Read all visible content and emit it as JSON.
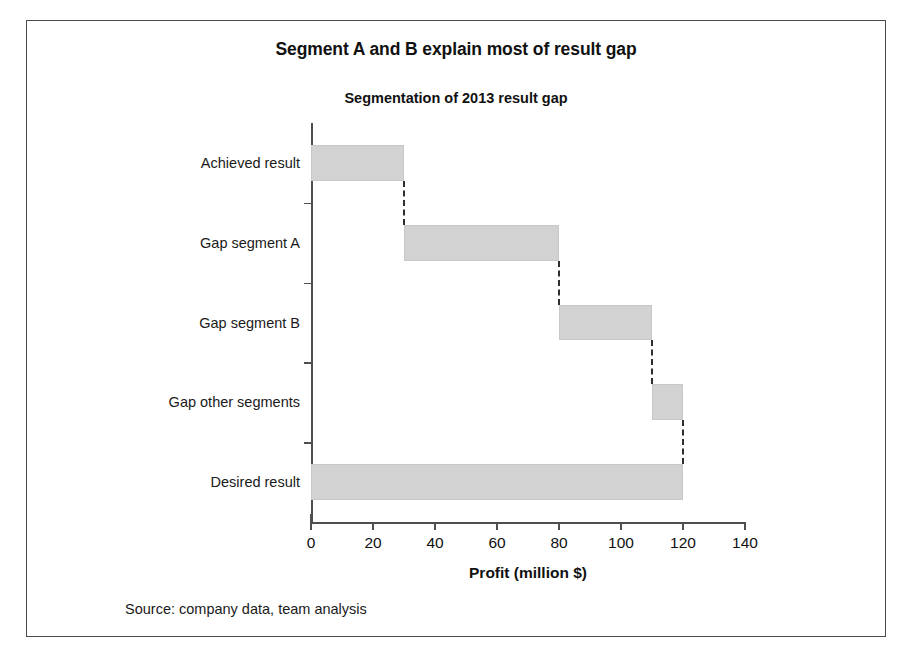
{
  "figure": {
    "title": "Segment A and B explain most of result gap",
    "subtitle": "Segmentation of 2013 result gap",
    "source": "Source: company data, team analysis"
  },
  "chart_data": {
    "type": "bar",
    "subtype": "waterfall-horizontal",
    "title": "Segmentation of 2013 result gap",
    "xlabel": "Profit (million $)",
    "ylabel": "",
    "xlim": [
      0,
      140
    ],
    "xticks": [
      0,
      20,
      40,
      60,
      80,
      100,
      120,
      140
    ],
    "xtick_labels": [
      "0",
      "20",
      "40",
      "60",
      "80",
      "100",
      "120",
      "140"
    ],
    "grid": false,
    "legend": false,
    "orientation": "horizontal",
    "bar_color": "#d2d2d2",
    "connector_color": "#2e2e2e",
    "connector_style": "dashed",
    "categories": [
      "Achieved result",
      "Gap segment A",
      "Gap segment B",
      "Gap other segments",
      "Desired result"
    ],
    "bars": [
      {
        "label": "Achieved result",
        "start": 0,
        "end": 30,
        "value": 30
      },
      {
        "label": "Gap segment A",
        "start": 30,
        "end": 80,
        "value": 50
      },
      {
        "label": "Gap segment B",
        "start": 80,
        "end": 110,
        "value": 30
      },
      {
        "label": "Gap other segments",
        "start": 110,
        "end": 120,
        "value": 10
      },
      {
        "label": "Desired result",
        "start": 0,
        "end": 120,
        "value": 120
      }
    ]
  }
}
